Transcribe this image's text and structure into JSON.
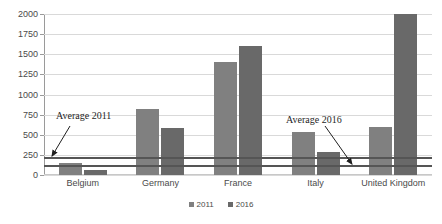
{
  "chart_data": {
    "type": "bar",
    "title": "",
    "xlabel": "",
    "ylabel": "",
    "ylim": [
      0,
      2000
    ],
    "yticks": [
      0,
      250,
      500,
      750,
      1000,
      1250,
      1500,
      1750,
      2000
    ],
    "ytick_labels": [
      "0",
      "250",
      "500",
      "750",
      "1000",
      "1250",
      "1500",
      "1750",
      "2000"
    ],
    "grid": true,
    "legend_position": "bottom-center",
    "categories": [
      "Belgium",
      "Germany",
      "France",
      "Italy",
      "United Kingdom"
    ],
    "series": [
      {
        "name": "2011",
        "color": "#808080",
        "values": [
          150,
          820,
          1400,
          530,
          600
        ]
      },
      {
        "name": "2016",
        "color": "#696969",
        "values": [
          60,
          580,
          1600,
          280,
          2000
        ]
      }
    ],
    "reference_lines": [
      {
        "label": "Average 2011",
        "value": 210,
        "color": "#555555"
      },
      {
        "label": "Average 2016",
        "value": 110,
        "color": "#555555"
      }
    ],
    "annotations": [
      {
        "text": "Average 2011",
        "points_to": "Average 2011 line"
      },
      {
        "text": "Average 2016",
        "points_to": "Average 2016 line"
      }
    ]
  },
  "legend": {
    "items": [
      {
        "label": "2011"
      },
      {
        "label": "2016"
      }
    ]
  }
}
